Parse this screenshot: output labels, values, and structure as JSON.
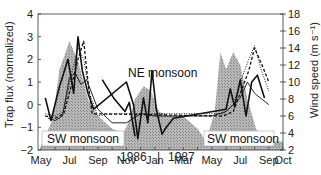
{
  "chart_data": {
    "type": "line",
    "title": "",
    "xlabel": "",
    "ylabel_left": "Trap flux (normalized)",
    "ylabel_right": "Wind speed (m s⁻¹)",
    "ylim_left": [
      -2,
      4
    ],
    "ylim_right": [
      2,
      18
    ],
    "yticks_left": [
      -2,
      -1,
      0,
      1,
      2,
      3,
      4
    ],
    "yticks_right": [
      2,
      4,
      6,
      8,
      10,
      12,
      14,
      16,
      18
    ],
    "x_tick_labels": [
      "May",
      "Jul",
      "Sep",
      "Nov",
      "Jan",
      "Mar",
      "May",
      "Jul",
      "Sep",
      "Oct"
    ],
    "year_labels": [
      "1986",
      "1987"
    ],
    "annotations": [
      "NE monsoon",
      "SW monsoon",
      "SW monsoon"
    ],
    "grid": false,
    "x_months_index": "0 = May 1986, 17 = Oct 1987",
    "series": [
      {
        "name": "Wind speed (shaded area)",
        "axis": "right",
        "style": "shaded-hatched",
        "x": [
          0,
          0.8,
          1.3,
          2.0,
          2.6,
          3.3,
          4.0,
          5.0,
          5.8,
          6.2,
          6.6,
          7.2,
          7.7,
          8.3,
          9.0,
          10.0,
          11.0,
          11.6,
          12.2,
          12.6,
          13.0,
          13.5,
          14.0,
          14.5,
          15.1,
          15.7,
          16.3,
          17.0
        ],
        "values": [
          2.5,
          5.5,
          11.5,
          14.8,
          12.5,
          8.0,
          6.0,
          4.5,
          4.0,
          5.5,
          8.0,
          9.5,
          9.0,
          6.5,
          6.0,
          6.0,
          4.5,
          3.0,
          6.5,
          13.5,
          11.5,
          13.5,
          12.0,
          8.0,
          4.5,
          3.0,
          3.0,
          3.0
        ]
      },
      {
        "name": "Trap flux trap 1 (thin solid)",
        "axis": "left",
        "style": "solid-thin",
        "x": [
          0.5,
          1.0,
          1.5,
          2.0,
          2.4,
          2.8,
          3.2,
          4.0,
          5.0,
          6.0,
          7.0,
          8.0,
          9.0,
          10.0,
          11.0,
          12.0,
          13.0,
          14.0,
          14.5,
          15.0,
          16.0
        ],
        "values": [
          -0.6,
          -0.7,
          -0.5,
          1.2,
          1.4,
          0.9,
          1.1,
          -0.2,
          -0.8,
          -0.8,
          -0.4,
          -0.5,
          -0.5,
          -0.5,
          -0.5,
          -0.5,
          -0.3,
          0.3,
          1.0,
          0.5,
          0.0
        ]
      },
      {
        "name": "Trap flux trap 2 (thick solid)",
        "axis": "left",
        "style": "solid-thick",
        "x": [
          0.3,
          0.7,
          1.3,
          1.9,
          2.3,
          2.6,
          2.9,
          3.3,
          3.7,
          6.0,
          6.5,
          6.8,
          7.2,
          7.5,
          7.8,
          8.1,
          8.5,
          8.8,
          9.3,
          13.0,
          13.3,
          13.6,
          14.0,
          14.4,
          14.8,
          15.2,
          15.7
        ],
        "values": [
          0.3,
          -0.7,
          0.8,
          2.0,
          0.5,
          3.0,
          1.5,
          0.5,
          -0.2,
          1.0,
          0.0,
          -1.5,
          0.3,
          -0.8,
          1.5,
          -0.2,
          -1.3,
          -1.0,
          -0.6,
          -0.2,
          0.7,
          -0.1,
          1.1,
          -0.5,
          1.0,
          1.3,
          0.3
        ]
      },
      {
        "name": "Trap flux trap 3 (dashed)",
        "axis": "left",
        "style": "dashed",
        "x": [
          0.3,
          1.0,
          1.6,
          2.2,
          2.6,
          3.0,
          3.3,
          3.6,
          12.8,
          13.5,
          14.0,
          14.6,
          15.0,
          15.5,
          16.0
        ],
        "values": [
          -0.5,
          -0.6,
          -0.4,
          1.0,
          2.0,
          2.8,
          1.0,
          -0.4,
          -0.5,
          -0.3,
          0.5,
          1.5,
          2.5,
          1.8,
          1.0
        ]
      },
      {
        "name": "Trap flux trap 4 (dotted)",
        "axis": "left",
        "style": "dotted",
        "x": [
          0.3,
          1.0,
          1.6,
          2.2,
          2.6,
          3.0,
          3.4,
          4.0,
          5.0,
          6.0,
          12.8,
          13.5,
          14.0,
          14.6,
          15.0,
          15.5,
          16.0
        ],
        "values": [
          -0.4,
          -0.5,
          -0.3,
          1.5,
          2.5,
          2.0,
          0.5,
          -0.5,
          -0.4,
          -0.4,
          -0.4,
          0.0,
          1.0,
          2.0,
          2.6,
          1.5,
          0.6
        ]
      },
      {
        "name": "Trap flux trap 5 (NE monsoon thick)",
        "axis": "left",
        "style": "solid-thick",
        "x": [
          4.3,
          5.1,
          5.9,
          6.2,
          6.6
        ],
        "values": [
          1.1,
          0.3,
          -0.3,
          0.1,
          -1.4
        ]
      }
    ]
  },
  "labels": {
    "ylabel_left": "Trap flux (normalized)",
    "ylabel_right": "Wind speed (m s⁻¹)",
    "annot_ne": "NE monsoon",
    "annot_sw1": "SW monsoon",
    "annot_sw2": "SW monsoon",
    "year1": "1986",
    "year_sep": "|",
    "year2": "1987"
  }
}
